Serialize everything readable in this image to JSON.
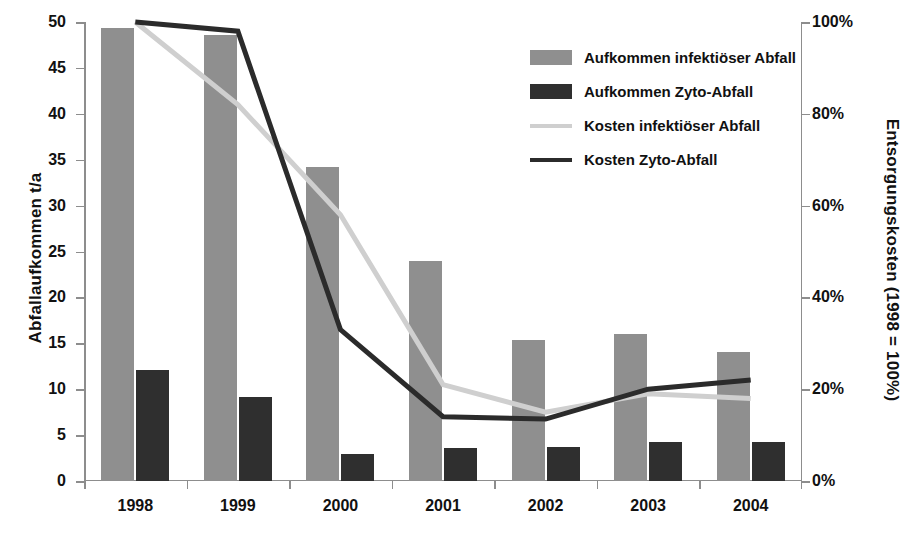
{
  "chart_data": {
    "type": "bar",
    "title": "",
    "categories": [
      "1998",
      "1999",
      "2000",
      "2001",
      "2002",
      "2003",
      "2004"
    ],
    "xlabel": "",
    "ylabel": "Abfallaufkommen  t/a",
    "ylabel_secondary": "Entsorgungskosten (1998 = 100%)",
    "ylim": [
      0,
      50
    ],
    "ylim_secondary": [
      0,
      100
    ],
    "yticks": [
      0,
      5,
      10,
      15,
      20,
      25,
      30,
      35,
      40,
      45,
      50
    ],
    "ytick_labels": [
      "0",
      "5",
      "10",
      "15",
      "20",
      "25",
      "30",
      "35",
      "40",
      "45",
      "50"
    ],
    "yticks_secondary": [
      0,
      20,
      40,
      60,
      80,
      100
    ],
    "ytick_labels_secondary": [
      "0%",
      "20%",
      "40%",
      "60%",
      "80%",
      "100%"
    ],
    "grid": false,
    "legend_position": "upper right",
    "series": [
      {
        "name": "Aufkommen infektiöser Abfall",
        "kind": "bar",
        "axis": "left",
        "color": "#8f8f8f",
        "values": [
          49.4,
          48.6,
          34.2,
          24.0,
          15.4,
          16.0,
          14.0
        ]
      },
      {
        "name": "Aufkommen Zyto-Abfall",
        "kind": "bar",
        "axis": "left",
        "color": "#2f2f2f",
        "values": [
          12.1,
          9.1,
          2.9,
          3.6,
          3.7,
          4.2,
          4.3
        ]
      },
      {
        "name": "Kosten infektiöser Abfall",
        "kind": "line",
        "axis": "right",
        "color": "#cfcfcf",
        "values": [
          100,
          82,
          58,
          21,
          15,
          19,
          18
        ]
      },
      {
        "name": "Kosten Zyto-Abfall",
        "kind": "line",
        "axis": "right",
        "color": "#2b2b2b",
        "values": [
          100,
          98,
          33,
          14,
          13.5,
          20,
          22
        ]
      }
    ]
  },
  "legend": {
    "items": [
      {
        "label": "Aufkommen infektiöser Abfall",
        "swatch": "bar-infect"
      },
      {
        "label": "Aufkommen Zyto-Abfall",
        "swatch": "bar-zyto"
      },
      {
        "label": "Kosten infektiöser Abfall",
        "swatch": "line-infect"
      },
      {
        "label": "Kosten Zyto-Abfall",
        "swatch": "line-zyto"
      }
    ]
  },
  "colors": {
    "bar_infect": "#8f8f8f",
    "bar_zyto": "#2f2f2f",
    "line_infect": "#cfcfcf",
    "line_zyto": "#2b2b2b",
    "axis": "#8d8d8d",
    "text": "#111111",
    "background": "#ffffff"
  }
}
